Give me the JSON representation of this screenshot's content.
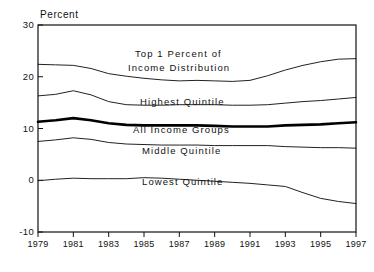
{
  "chart_data": {
    "type": "line",
    "title": "",
    "ylabel": "Percent",
    "xlabel": "",
    "ylim": [
      -10,
      30
    ],
    "xlim": [
      1979,
      1997
    ],
    "grid": false,
    "legend_position": "inline-annotations",
    "yticks": [
      "30",
      "20",
      "10",
      "0",
      "-10"
    ],
    "ytick_values": [
      30,
      20,
      10,
      0,
      -10
    ],
    "xticks": [
      "1979",
      "1981",
      "1983",
      "1985",
      "1987",
      "1989",
      "1991",
      "1993",
      "1995",
      "1997"
    ],
    "xtick_values": [
      1979,
      1981,
      1983,
      1985,
      1987,
      1989,
      1991,
      1993,
      1995,
      1997
    ],
    "x": [
      1979,
      1980,
      1981,
      1982,
      1983,
      1984,
      1985,
      1986,
      1987,
      1988,
      1989,
      1990,
      1991,
      1992,
      1993,
      1994,
      1995,
      1996,
      1997
    ],
    "series": [
      {
        "name": "Top 1 Percent of Income Distribution",
        "style": "thin",
        "values": [
          22.4,
          22.3,
          22.2,
          21.6,
          20.6,
          20.1,
          19.7,
          19.4,
          19.2,
          19.3,
          19.2,
          19.1,
          19.3,
          20.2,
          21.3,
          22.2,
          22.9,
          23.4,
          23.5
        ]
      },
      {
        "name": "Highest Quintile",
        "style": "thin",
        "values": [
          16.3,
          16.6,
          17.3,
          16.5,
          15.2,
          14.6,
          14.5,
          14.5,
          14.6,
          14.6,
          14.6,
          14.5,
          14.5,
          14.6,
          14.9,
          15.2,
          15.4,
          15.7,
          16.0
        ]
      },
      {
        "name": "All Income Groups",
        "style": "bold",
        "values": [
          11.3,
          11.6,
          12.0,
          11.6,
          11.0,
          10.7,
          10.6,
          10.6,
          10.6,
          10.6,
          10.5,
          10.4,
          10.4,
          10.4,
          10.6,
          10.7,
          10.8,
          11.0,
          11.2
        ]
      },
      {
        "name": "Middle Quintile",
        "style": "thin",
        "values": [
          7.5,
          7.8,
          8.2,
          7.9,
          7.3,
          7.0,
          6.9,
          6.8,
          6.8,
          6.8,
          6.7,
          6.7,
          6.7,
          6.7,
          6.5,
          6.4,
          6.3,
          6.3,
          6.2
        ]
      },
      {
        "name": "Lowest Quintile",
        "style": "thin",
        "values": [
          -0.1,
          0.2,
          0.4,
          0.3,
          0.3,
          0.3,
          0.5,
          0.4,
          0.2,
          0.0,
          -0.2,
          -0.4,
          -0.6,
          -0.9,
          -1.2,
          -2.4,
          -3.5,
          -4.1,
          -4.5
        ]
      }
    ],
    "annotations": [
      {
        "text": "Top 1 Percent of",
        "x_px": 135,
        "y_px": 48
      },
      {
        "text": "Income Distribution",
        "x_px": 128,
        "y_px": 62
      },
      {
        "text": "Highest Quintile",
        "x_px": 140,
        "y_px": 96
      },
      {
        "text": "All Income Groups",
        "x_px": 133,
        "y_px": 124
      },
      {
        "text": "Middle Quintile",
        "x_px": 142,
        "y_px": 145
      },
      {
        "text": "Lowest Quintile",
        "x_px": 142,
        "y_px": 176
      }
    ]
  },
  "axis": {
    "ylabel_text": "Percent"
  },
  "colors": {
    "background": "#ffffff",
    "axis": "#111111",
    "line_thin": "#222222",
    "line_bold": "#000000"
  }
}
